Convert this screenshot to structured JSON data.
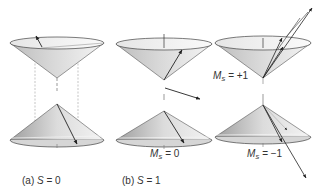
{
  "figure": {
    "panels": [
      {
        "id": "a",
        "caption_prefix": "(a)",
        "caption_var": "S",
        "caption_eq": "= 0",
        "cones": [
          "upper",
          "lower"
        ],
        "state": "singlet"
      },
      {
        "id": "b",
        "caption_prefix": "(b)",
        "caption_var": "S",
        "caption_eq": "= 1",
        "state": "triplet",
        "substates": [
          {
            "label_var": "M",
            "label_sub": "S",
            "label_eq": "= 0"
          },
          {
            "label_var": "M",
            "label_sub": "S",
            "label_eq": "= +1"
          },
          {
            "label_var": "M",
            "label_sub": "S",
            "label_eq": "= −1"
          }
        ]
      }
    ]
  },
  "colors": {
    "line": "#3a3a3a",
    "cone_dark": "#9a9a9a",
    "cone_light": "#f2f2f2",
    "rim": "#ededed",
    "dashed": "#9c9c9c",
    "text": "#333333"
  }
}
